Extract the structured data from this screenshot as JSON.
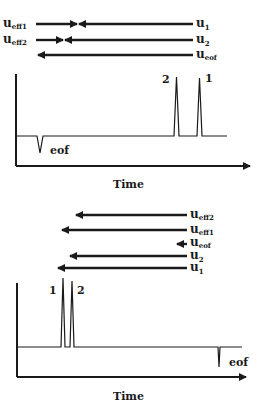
{
  "figure": {
    "panels": [
      {
        "id": "top",
        "velocity_arrows": [
          {
            "symbol": "u",
            "subscript": "eff1",
            "left_label": true,
            "components": "u_eff1 = u_1 (leftward) + opposing rightward"
          },
          {
            "symbol": "u",
            "subscript": "eff2",
            "left_label": true
          },
          {
            "symbol": "u",
            "subscript": "1",
            "side": "right"
          },
          {
            "symbol": "u",
            "subscript": "2",
            "side": "right"
          },
          {
            "symbol": "u",
            "subscript": "eof",
            "side": "right"
          }
        ],
        "labels": {
          "ueff1": {
            "main": "u",
            "sub": "eff1"
          },
          "ueff2": {
            "main": "u",
            "sub": "eff2"
          },
          "u1": {
            "main": "u",
            "sub": "1"
          },
          "u2": {
            "main": "u",
            "sub": "2"
          },
          "ueof": {
            "main": "u",
            "sub": "eof"
          }
        },
        "peaks": {
          "peak_a": "2",
          "peak_b": "1"
        },
        "eof_label": "eof",
        "x_axis_title": "Time"
      },
      {
        "id": "bottom",
        "labels": {
          "ueff2": {
            "main": "u",
            "sub": "eff2"
          },
          "ueff1": {
            "main": "u",
            "sub": "eff1"
          },
          "ueof": {
            "main": "u",
            "sub": "eof"
          },
          "u2": {
            "main": "u",
            "sub": "2"
          },
          "u1": {
            "main": "u",
            "sub": "1"
          }
        },
        "peaks": {
          "peak_a": "1",
          "peak_b": "2"
        },
        "eof_label": "eof",
        "x_axis_title": "Time"
      }
    ],
    "colors": {
      "ink": "#1a1a1a",
      "background": "#ffffff"
    }
  }
}
